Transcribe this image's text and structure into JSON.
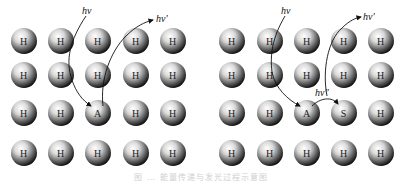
{
  "figure": {
    "caption": "图 … 能量传递与发光过程示意图",
    "colors": {
      "atom_dark": "#111111",
      "atom_light": "#f2f2f2",
      "arrow": "#111111",
      "background": "#ffffff"
    },
    "panels": [
      {
        "id": "left",
        "columns_x": [
          24,
          61,
          98,
          136,
          173
        ],
        "rows_y": [
          41,
          75,
          113,
          153
        ],
        "grid": [
          [
            "H",
            "H",
            "H",
            "H",
            "H"
          ],
          [
            "H",
            "H",
            "H",
            "H",
            "H"
          ],
          [
            "H",
            "H",
            "A",
            "H",
            "H"
          ],
          [
            "H",
            "H",
            "H",
            "H",
            "H"
          ]
        ],
        "labels": {
          "incoming": "hν",
          "outgoing": "hν'"
        }
      },
      {
        "id": "right",
        "columns_x": [
          232,
          270,
          307,
          344,
          381
        ],
        "rows_y": [
          41,
          75,
          113,
          153
        ],
        "grid": [
          [
            "H",
            "H",
            "H",
            "H",
            "H"
          ],
          [
            "H",
            "H",
            "H",
            "H",
            "H"
          ],
          [
            "H",
            "H",
            "A",
            "S",
            "H"
          ],
          [
            "H",
            "H",
            "H",
            "H",
            "H"
          ]
        ],
        "labels": {
          "incoming": "hν",
          "transfer": "hν''",
          "outgoing": "hν'"
        }
      }
    ]
  }
}
